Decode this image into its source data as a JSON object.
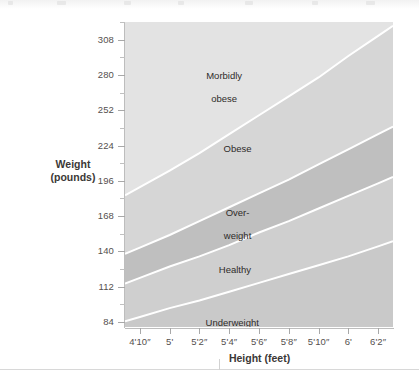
{
  "chart_data": {
    "type": "area",
    "title": "",
    "subtitle": "",
    "xlabel": "Height (feet)",
    "ylabel": "Weight\n(pounds)",
    "ylabel_lines": [
      "Weight",
      "(pounds)"
    ],
    "grid": false,
    "legend_position": "inline-annotations",
    "x": [
      "4'10″",
      "5'",
      "5'2″",
      "5'4″",
      "5'6″",
      "5'8″",
      "5'10″",
      "6'",
      "6'2″"
    ],
    "x_inches": [
      58,
      60,
      62,
      64,
      66,
      68,
      70,
      72,
      74
    ],
    "xlim_inches": [
      57,
      75
    ],
    "xtick_labels": [
      "4'10″",
      "5'",
      "5'2″",
      "5'4″",
      "5'6″",
      "5'8″",
      "5'10″",
      "6'",
      "6'2″"
    ],
    "ytick_labels": [
      "84",
      "112",
      "140",
      "168",
      "196",
      "224",
      "252",
      "280",
      "308"
    ],
    "ytick_values": [
      84,
      112,
      140,
      168,
      196,
      224,
      252,
      280,
      308
    ],
    "yminor_values": [
      98,
      126,
      154,
      182,
      210,
      238,
      266,
      294,
      322
    ],
    "ylim": [
      80,
      322
    ],
    "ytick_step": 28,
    "boundaries": [
      {
        "name": "Underweight / Healthy boundary",
        "bmi": 18.5,
        "weights_lb": [
          88,
          95,
          101,
          108,
          115,
          122,
          129,
          136,
          144
        ]
      },
      {
        "name": "Healthy / Overweight boundary",
        "bmi": 25,
        "weights_lb": [
          119,
          128,
          136,
          145,
          155,
          164,
          174,
          184,
          194
        ]
      },
      {
        "name": "Overweight / Obese boundary",
        "bmi": 30,
        "weights_lb": [
          143,
          153,
          164,
          175,
          186,
          197,
          209,
          221,
          233
        ]
      },
      {
        "name": "Obese / Morbidly obese boundary",
        "bmi": 40,
        "weights_lb": [
          191,
          204,
          218,
          233,
          248,
          263,
          278,
          295,
          311
        ]
      }
    ],
    "bands": [
      {
        "label": "Underweight",
        "label_lines": [
          "Underweight"
        ],
        "bmi_range": "below 18.5",
        "color": "#c9c9c9",
        "label_x_pct": 40,
        "label_y_pct": 93
      },
      {
        "label": "Healthy",
        "label_lines": [
          "Healthy"
        ],
        "bmi_range": "18.5 - 25",
        "color": "#cfcfcf",
        "label_x_pct": 41,
        "label_y_pct": 75.5
      },
      {
        "label": "Over-weight",
        "label_lines": [
          "Over-",
          "weight"
        ],
        "bmi_range": "25 - 30",
        "color": "#bfbfbf",
        "label_x_pct": 42,
        "label_y_pct": 57
      },
      {
        "label": "Obese",
        "label_lines": [
          "Obese"
        ],
        "bmi_range": "30 - 40",
        "color": "#d6d6d6",
        "label_x_pct": 42,
        "label_y_pct": 36
      },
      {
        "label": "Morbidly obese",
        "label_lines": [
          "Morbidly",
          "obese"
        ],
        "bmi_range": "40 and above",
        "color": "#e3e3e3",
        "label_x_pct": 37,
        "label_y_pct": 12
      }
    ],
    "boundary_line_color": "#ffffff",
    "plot_background": "#e6e6e6",
    "text_color": "#2e2b29",
    "axis_text_color": "#55504e"
  },
  "axes": {
    "y_title_lines": [
      "Weight",
      "(pounds)"
    ],
    "x_title": "Height (feet)"
  }
}
